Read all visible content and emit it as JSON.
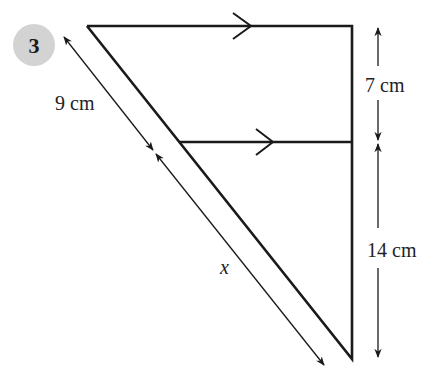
{
  "question": {
    "number": "3",
    "badge_color": "#d3d3d3"
  },
  "figure": {
    "type": "similar-triangles-parallel-lines",
    "line_color": "#1a1a1a",
    "labels": {
      "top_side_segment": "9 cm",
      "bottom_side_segment": "x",
      "upper_right_segment": "7 cm",
      "lower_right_segment": "14 cm"
    },
    "parallel_marks": [
      "top-edge-arrow",
      "middle-line-arrow"
    ]
  }
}
